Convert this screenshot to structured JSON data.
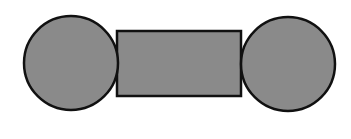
{
  "diagram": {
    "colors": {
      "fill": "#8a8a8a",
      "stroke": "#111111",
      "background": "#ffffff"
    },
    "shapes": [
      {
        "type": "circle",
        "name": "left-circle",
        "cx": 71,
        "cy": 63,
        "r": 47
      },
      {
        "type": "rect",
        "name": "center-rect",
        "x": 117,
        "y": 31,
        "width": 124,
        "height": 65
      },
      {
        "type": "circle",
        "name": "right-circle",
        "cx": 288,
        "cy": 64,
        "r": 47
      }
    ]
  }
}
